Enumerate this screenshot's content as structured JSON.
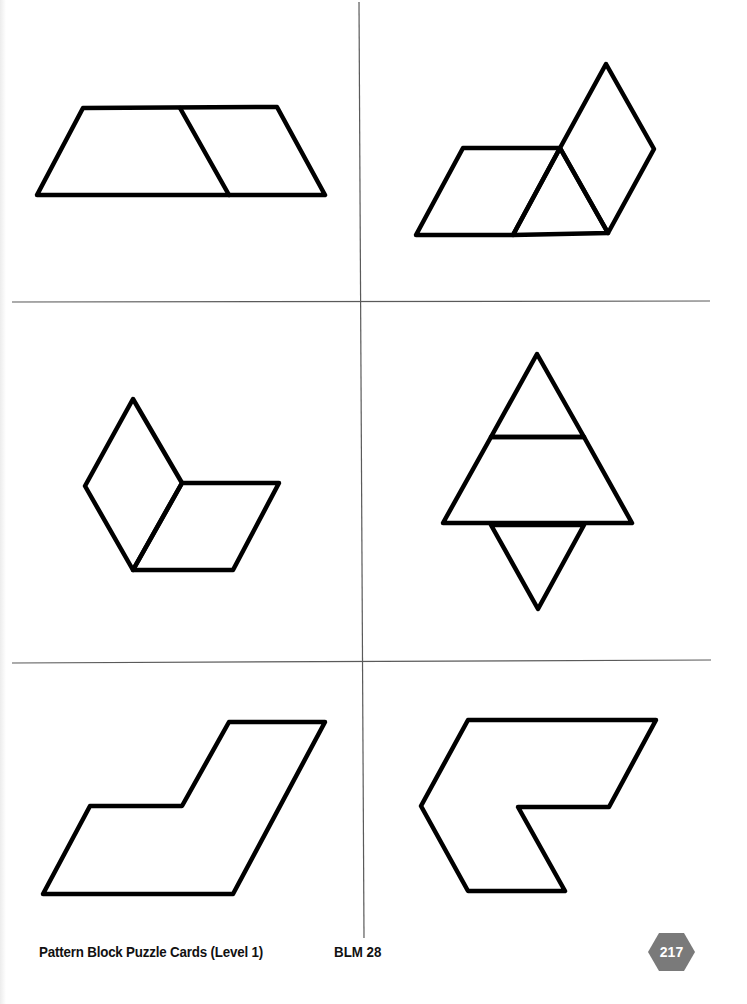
{
  "page": {
    "footer_title": "Pattern Block Puzzle Cards (Level 1)",
    "footer_code": "BLM  28",
    "page_number": "217",
    "badge_color": "#7a7a7a",
    "outline_color": "#000000",
    "cut_line_color": "#555555"
  },
  "cards": [
    {
      "position": "top-left",
      "description": "Trapezoid made of a trapezoid-half and a rhombus"
    },
    {
      "position": "top-right",
      "description": "Parallelogram, triangle and rhombus"
    },
    {
      "position": "middle-left",
      "description": "Two rhombuses forming a chevron"
    },
    {
      "position": "middle-right",
      "description": "Triangle over trapezoid over inverted triangle"
    },
    {
      "position": "bottom-left",
      "description": "Stepped parallelogram outline"
    },
    {
      "position": "bottom-right",
      "description": "Hexagon-notched chevron outline"
    }
  ]
}
